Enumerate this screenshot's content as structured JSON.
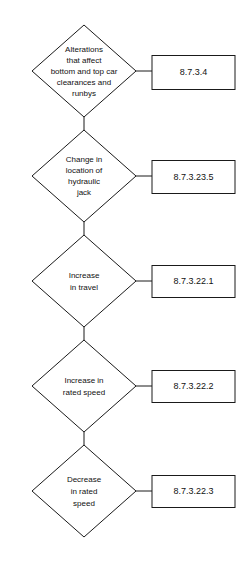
{
  "diagram": {
    "type": "flowchart",
    "orientation": "vertical",
    "background_color": "#ffffff",
    "line_color": "#1a1a1a",
    "text_color": "#111111",
    "nodes": [
      {
        "id": "node-1",
        "shape": "diamond",
        "lines": [
          "Alterations",
          "that affect",
          "bottom and top car",
          "clearances and",
          "runbys"
        ],
        "reference": {
          "id": "ref-1",
          "shape": "rectangle",
          "label": "8.7.3.4"
        }
      },
      {
        "id": "node-2",
        "shape": "diamond",
        "lines": [
          "Change in",
          "location of",
          "hydraulic",
          "jack"
        ],
        "reference": {
          "id": "ref-2",
          "shape": "rectangle",
          "label": "8.7.3.23.5"
        }
      },
      {
        "id": "node-3",
        "shape": "diamond",
        "lines": [
          "Increase",
          "in travel"
        ],
        "reference": {
          "id": "ref-3",
          "shape": "rectangle",
          "label": "8.7.3.22.1"
        }
      },
      {
        "id": "node-4",
        "shape": "diamond",
        "lines": [
          "Increase in",
          "rated speed"
        ],
        "reference": {
          "id": "ref-4",
          "shape": "rectangle",
          "label": "8.7.3.22.2"
        }
      },
      {
        "id": "node-5",
        "shape": "diamond",
        "lines": [
          "Decrease",
          "in rated",
          "speed"
        ],
        "reference": {
          "id": "ref-5",
          "shape": "rectangle",
          "label": "8.7.3.22.3"
        }
      }
    ]
  }
}
